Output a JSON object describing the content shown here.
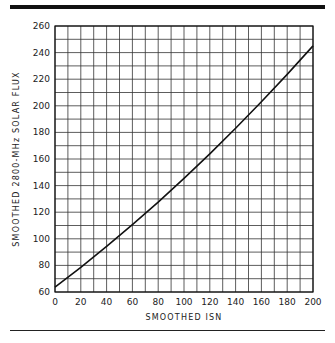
{
  "chart_data": {
    "type": "line",
    "title": "",
    "xlabel": "SMOOTHED ISN",
    "ylabel": "SMOOTHED 2800-MHz SOLAR FLUX",
    "xlim": [
      0,
      200
    ],
    "ylim": [
      60,
      260
    ],
    "grid": true,
    "x_ticks": [
      0,
      20,
      40,
      60,
      80,
      100,
      120,
      140,
      160,
      180,
      200
    ],
    "y_ticks": [
      60,
      80,
      100,
      120,
      140,
      160,
      180,
      200,
      220,
      240,
      260
    ],
    "series": [
      {
        "name": "Solar flux vs ISN",
        "x": [
          0,
          20,
          40,
          60,
          80,
          100,
          120,
          140,
          160,
          180,
          200
        ],
        "y": [
          63.7,
          78.6,
          94.3,
          110.6,
          127.6,
          145.4,
          163.9,
          183.1,
          203.0,
          223.6,
          245.0
        ]
      }
    ],
    "legend": null
  }
}
